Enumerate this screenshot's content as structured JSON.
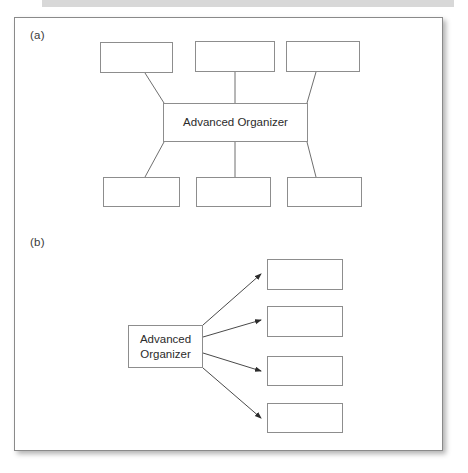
{
  "figure": {
    "panel_a_label": "(a)",
    "panel_b_label": "(b)",
    "organizer_label_a": "Advanced Organizer",
    "organizer_label_b_line1": "Advanced",
    "organizer_label_b_line2": "Organizer",
    "frame_border_color": "#8a8a8a",
    "box_border_color": "#8d8d8d",
    "line_color": "#6f6f6f",
    "arrow_color": "#2b2b2b",
    "background_color": "#ffffff",
    "text_color": "#2b2b2b"
  },
  "panel_a": {
    "label": "(a)",
    "center_node": {
      "label": "Advanced Organizer",
      "x": 163,
      "y": 103,
      "w": 145,
      "h": 39
    },
    "top_nodes": [
      {
        "label": "",
        "x": 100,
        "y": 42,
        "w": 73,
        "h": 31
      },
      {
        "label": "",
        "x": 195,
        "y": 41,
        "w": 80,
        "h": 31
      },
      {
        "label": "",
        "x": 286,
        "y": 41,
        "w": 74,
        "h": 31
      }
    ],
    "bottom_nodes": [
      {
        "label": "",
        "x": 103,
        "y": 177,
        "w": 77,
        "h": 30
      },
      {
        "label": "",
        "x": 196,
        "y": 177,
        "w": 75,
        "h": 30
      },
      {
        "label": "",
        "x": 287,
        "y": 177,
        "w": 75,
        "h": 30
      }
    ],
    "connectors": [
      {
        "from": "top-node-1",
        "to": "center-node",
        "x1": 145,
        "y1": 73,
        "x2": 164,
        "y2": 103
      },
      {
        "from": "top-node-2",
        "to": "center-node",
        "x1": 235,
        "y1": 72,
        "x2": 235,
        "y2": 103
      },
      {
        "from": "top-node-3",
        "to": "center-node",
        "x1": 316,
        "y1": 72,
        "x2": 307,
        "y2": 103
      },
      {
        "from": "center-node",
        "to": "bottom-node-1",
        "x1": 164,
        "y1": 142,
        "x2": 145,
        "y2": 177
      },
      {
        "from": "center-node",
        "to": "bottom-node-2",
        "x1": 235,
        "y1": 142,
        "x2": 235,
        "y2": 177
      },
      {
        "from": "center-node",
        "to": "bottom-node-3",
        "x1": 307,
        "y1": 142,
        "x2": 316,
        "y2": 177
      }
    ]
  },
  "panel_b": {
    "label": "(b)",
    "source_node": {
      "line1": "Advanced",
      "line2": "Organizer",
      "x": 128,
      "y": 325,
      "w": 75,
      "h": 43
    },
    "target_nodes": [
      {
        "label": "",
        "x": 267,
        "y": 259,
        "w": 76,
        "h": 31
      },
      {
        "label": "",
        "x": 267,
        "y": 306,
        "w": 76,
        "h": 31
      },
      {
        "label": "",
        "x": 267,
        "y": 356,
        "w": 76,
        "h": 30
      },
      {
        "label": "",
        "x": 267,
        "y": 403,
        "w": 76,
        "h": 30
      }
    ],
    "arrows": [
      {
        "from": "source-node",
        "to": "target-node-1",
        "x1": 203,
        "y1": 325,
        "x2": 261,
        "y2": 274
      },
      {
        "from": "source-node",
        "to": "target-node-2",
        "x1": 203,
        "y1": 337,
        "x2": 261,
        "y2": 320
      },
      {
        "from": "source-node",
        "to": "target-node-3",
        "x1": 203,
        "y1": 353,
        "x2": 261,
        "y2": 371
      },
      {
        "from": "source-node",
        "to": "target-node-4",
        "x1": 203,
        "y1": 368,
        "x2": 261,
        "y2": 418
      }
    ]
  }
}
